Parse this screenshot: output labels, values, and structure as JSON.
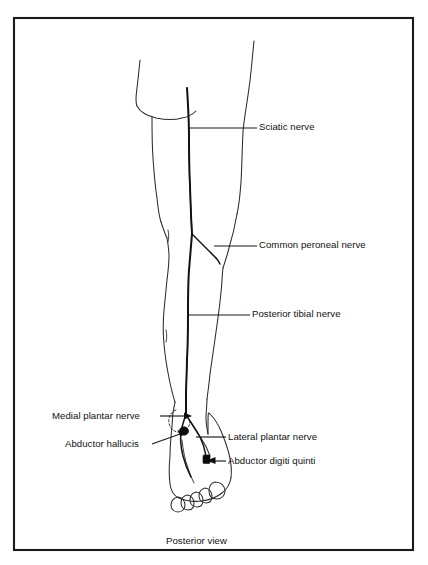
{
  "figure": {
    "caption": "Posterior view",
    "view": "Posterior view",
    "border_color": "#1a1a1a",
    "line_color": "#2b2b2b",
    "nerve_color": "#111111",
    "background_color": "#ffffff"
  },
  "labels": [
    {
      "id": "sciatic-nerve",
      "text": "Sciatic nerve",
      "side": "right",
      "x": 259,
      "y": 122,
      "leader": {
        "from_x": 190,
        "from_y": 128,
        "to_x": 257,
        "to_y": 128,
        "arrow": false
      }
    },
    {
      "id": "common-peroneal-nerve",
      "text": "Common peroneal nerve",
      "side": "right",
      "x": 259,
      "y": 240,
      "leader": {
        "from_x": 214,
        "from_y": 246,
        "to_x": 257,
        "to_y": 246,
        "arrow": false
      }
    },
    {
      "id": "posterior-tibial-nerve",
      "text": "Posterior tibial nerve",
      "side": "right",
      "x": 252,
      "y": 309,
      "leader": {
        "from_x": 189,
        "from_y": 315,
        "to_x": 250,
        "to_y": 315,
        "arrow": false
      }
    },
    {
      "id": "medial-plantar-nerve",
      "text": "Medial plantar nerve",
      "side": "left",
      "x": 52,
      "y": 411,
      "leader": {
        "from_x": 160,
        "from_y": 416,
        "to_x": 188,
        "to_y": 416,
        "arrow": true
      }
    },
    {
      "id": "abductor-hallucis",
      "text": "Abductor hallucis",
      "side": "left",
      "x": 65,
      "y": 439,
      "leader": {
        "from_x": 155,
        "from_y": 444,
        "to_x": 185,
        "to_y": 431,
        "arrow": true
      }
    },
    {
      "id": "lateral-plantar-nerve",
      "text": "Lateral plantar nerve",
      "side": "right",
      "x": 228,
      "y": 432,
      "leader": {
        "from_x": 196,
        "from_y": 437,
        "to_x": 226,
        "to_y": 437,
        "arrow": false
      }
    },
    {
      "id": "abductor-digiti-quinti",
      "text": "Abductor digiti quinti",
      "side": "right",
      "x": 228,
      "y": 456,
      "leader": {
        "from_x": 207,
        "from_y": 461,
        "to_x": 226,
        "to_y": 461,
        "arrow": true
      }
    }
  ],
  "anatomy": {
    "structures": [
      "gluteal-fold",
      "left-thigh-outline",
      "right-thigh-outline",
      "left-calf-outline",
      "right-calf-outline",
      "medial-malleolus",
      "foot-outline",
      "toes"
    ],
    "nerves": [
      "sciatic-nerve",
      "common-peroneal-nerve",
      "posterior-tibial-nerve",
      "medial-plantar-nerve",
      "lateral-plantar-nerve"
    ],
    "muscle_markers": [
      "abductor-hallucis",
      "abductor-digiti-quinti"
    ],
    "toe_count": 5
  }
}
